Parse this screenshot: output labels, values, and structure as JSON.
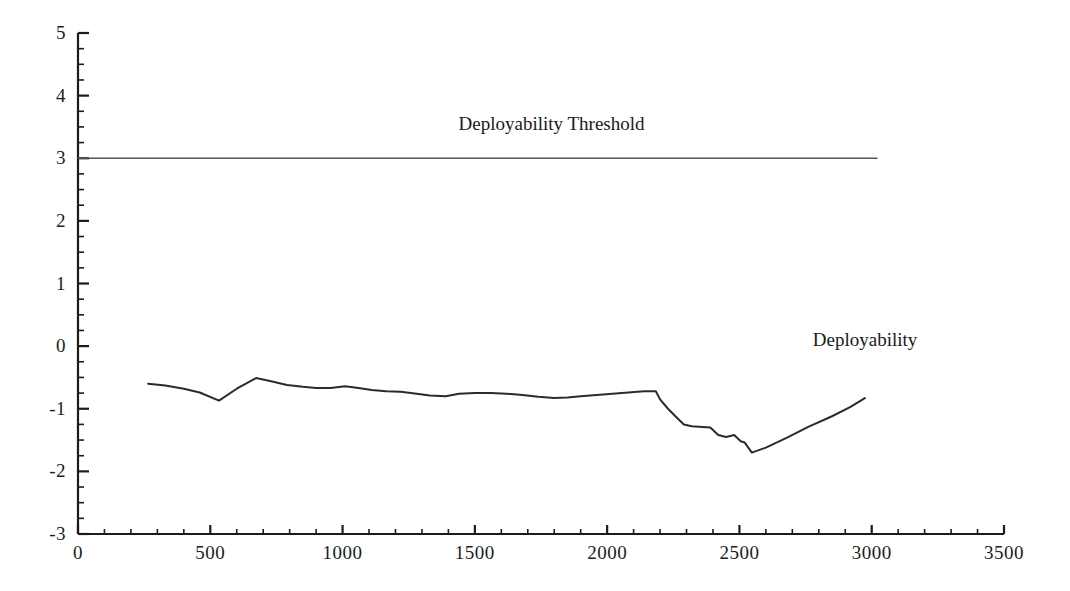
{
  "chart_data": {
    "type": "line",
    "title": "",
    "xlabel": "",
    "ylabel": "",
    "xlim": [
      0,
      3500
    ],
    "ylim": [
      -3,
      5
    ],
    "grid": false,
    "legend_position": "inline-annotation",
    "x_ticks": [
      0,
      500,
      1000,
      1500,
      2000,
      2500,
      3000,
      3500
    ],
    "x_tick_labels": [
      "0",
      "500",
      "1000",
      "1500",
      "2000",
      "2500",
      "3000",
      "3500"
    ],
    "x_minor_tick_step": 100,
    "y_ticks": [
      -3,
      -2,
      -1,
      0,
      1,
      2,
      3,
      4,
      5
    ],
    "y_tick_labels": [
      "-3",
      "-2",
      "-1",
      "0",
      "1",
      "2",
      "3",
      "4",
      "5"
    ],
    "y_minor_tick_step": 0.25,
    "series": [
      {
        "name": "Deployability Threshold",
        "annotation": "Deployability Threshold",
        "annotation_x": 1790,
        "annotation_y": 3.55,
        "color": "#555555",
        "line_width": 1.4,
        "x": [
          0,
          3020
        ],
        "values": [
          3,
          3
        ]
      },
      {
        "name": "Deployability",
        "annotation": "Deployability",
        "annotation_x": 2975,
        "annotation_y": 0.1,
        "color": "#2b2b2b",
        "line_width": 2,
        "x": [
          265,
          330,
          400,
          460,
          533,
          600,
          673,
          730,
          790,
          850,
          900,
          955,
          1010,
          1060,
          1110,
          1165,
          1220,
          1280,
          1330,
          1390,
          1440,
          1500,
          1560,
          1620,
          1680,
          1740,
          1800,
          1850,
          1900,
          1960,
          2020,
          2080,
          2140,
          2184,
          2200,
          2230,
          2258,
          2290,
          2320,
          2360,
          2390,
          2420,
          2450,
          2480,
          2505,
          2520,
          2547,
          2600,
          2680,
          2760,
          2850,
          2920,
          2974
        ],
        "values": [
          -0.6,
          -0.63,
          -0.68,
          -0.74,
          -0.87,
          -0.68,
          -0.51,
          -0.56,
          -0.62,
          -0.65,
          -0.67,
          -0.67,
          -0.64,
          -0.67,
          -0.7,
          -0.72,
          -0.73,
          -0.76,
          -0.79,
          -0.8,
          -0.76,
          -0.75,
          -0.75,
          -0.76,
          -0.78,
          -0.81,
          -0.83,
          -0.82,
          -0.8,
          -0.78,
          -0.76,
          -0.74,
          -0.72,
          -0.72,
          -0.85,
          -1.0,
          -1.12,
          -1.25,
          -1.28,
          -1.29,
          -1.3,
          -1.42,
          -1.45,
          -1.42,
          -1.52,
          -1.54,
          -1.7,
          -1.62,
          -1.46,
          -1.29,
          -1.12,
          -0.97,
          -0.83
        ]
      }
    ]
  },
  "axes": {
    "axis_color": "#1c1c1c",
    "axis_line_width": 2
  }
}
